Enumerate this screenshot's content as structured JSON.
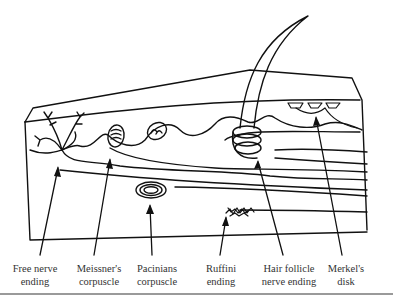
{
  "figure": {
    "labels": [
      {
        "id": "free-nerve-ending",
        "line1": "Free nerve",
        "line2": "ending"
      },
      {
        "id": "meissners-corpuscle",
        "line1": "Meissner's",
        "line2": "corpuscle"
      },
      {
        "id": "pacinians-corpuscle",
        "line1": "Pacinians",
        "line2": "corpuscle"
      },
      {
        "id": "ruffini-ending",
        "line1": "Ruffini",
        "line2": "ending"
      },
      {
        "id": "hair-follicle-nerve-ending",
        "line1": "Hair follicle",
        "line2": "nerve ending"
      },
      {
        "id": "merkels-disk",
        "line1": "Merkel's",
        "line2": "disk"
      }
    ],
    "colors": {
      "ink": "#111111",
      "label": "#333333",
      "rule": "#9a9a9a"
    }
  }
}
